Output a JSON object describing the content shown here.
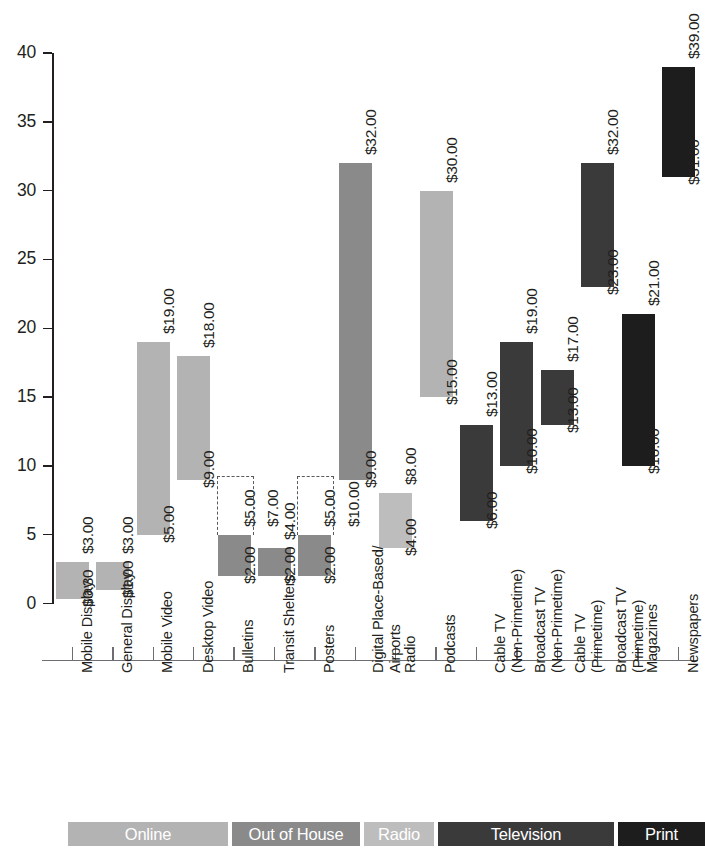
{
  "chart_data": {
    "type": "bar",
    "chart_style": "floating-range-bar",
    "title": "",
    "subtitle": "",
    "xlabel": "",
    "ylabel": "",
    "ylim": [
      0,
      40
    ],
    "y_ticks": [
      "0",
      "5",
      "10",
      "15",
      "20",
      "25",
      "30",
      "35",
      "40"
    ],
    "grid": false,
    "legend_position": "bottom",
    "categories": [
      "Mobile Display",
      "General Display",
      "Mobile Video",
      "Desktop Video",
      "Bulletins",
      "Transit Shelters",
      "Posters",
      "Digital Place-Based/ Airports",
      "Radio",
      "Podcasts",
      "Cable TV (Non-Primetime)",
      "Broadcast TV (Non-Primetime)",
      "Cable TV (Primetime)",
      "Broadcast TV (Primetime)",
      "Magazines",
      "Newspapers"
    ],
    "series": [
      {
        "name": "low",
        "values": [
          0.3,
          1.0,
          5.0,
          9.0,
          2.0,
          2.0,
          2.0,
          9.0,
          4.0,
          15.0,
          6.0,
          10.0,
          13.0,
          23.0,
          10.0,
          31.0
        ]
      },
      {
        "name": "high",
        "values": [
          3.0,
          3.0,
          19.0,
          18.0,
          5.0,
          4.0,
          5.0,
          32.0,
          8.0,
          30.0,
          13.0,
          19.0,
          17.0,
          32.0,
          21.0,
          39.0
        ]
      }
    ],
    "extended_high": [
      null,
      null,
      null,
      null,
      7.0,
      null,
      10.0,
      null,
      null,
      null,
      null,
      null,
      null,
      null,
      null,
      null
    ],
    "bars": [
      {
        "label": "Mobile Display",
        "group": "Online",
        "low": 0.3,
        "high": 3.0,
        "low_text": "$0.30",
        "high_text": "$3.00",
        "extra_text": null,
        "highlight": false
      },
      {
        "label": "General Display",
        "group": "Online",
        "low": 1.0,
        "high": 3.0,
        "low_text": "$1.00",
        "high_text": "$3.00",
        "extra_text": null,
        "highlight": false
      },
      {
        "label": "Mobile Video",
        "group": "Online",
        "low": 5.0,
        "high": 19.0,
        "low_text": "$5.00",
        "high_text": "$19.00",
        "extra_text": null,
        "highlight": false
      },
      {
        "label": "Desktop Video",
        "group": "Online",
        "low": 9.0,
        "high": 18.0,
        "low_text": "$9.00",
        "high_text": "$18.00",
        "extra_text": null,
        "highlight": false
      },
      {
        "label": "Bulletins",
        "group": "Out of House",
        "low": 2.0,
        "high": 5.0,
        "low_text": "$2.00",
        "high_text": "$5.00",
        "extra_text": "$7.00",
        "highlight": true
      },
      {
        "label": "Transit Shelters",
        "group": "Out of House",
        "low": 2.0,
        "high": 4.0,
        "low_text": "$2.00",
        "high_text": "$4.00",
        "extra_text": null,
        "highlight": false
      },
      {
        "label": "Posters",
        "group": "Out of House",
        "low": 2.0,
        "high": 5.0,
        "low_text": "$2.00",
        "high_text": "$5.00",
        "extra_text": "$10.00",
        "highlight": true
      },
      {
        "label": "Digital Place-Based/ Airports",
        "group": "Out of House",
        "low": 9.0,
        "high": 32.0,
        "low_text": "$9.00",
        "high_text": "$32.00",
        "extra_text": null,
        "highlight": false
      },
      {
        "label": "Radio",
        "group": "Radio",
        "low": 4.0,
        "high": 8.0,
        "low_text": "$4.00",
        "high_text": "$8.00",
        "extra_text": null,
        "highlight": false
      },
      {
        "label": "Podcasts",
        "group": "Online",
        "low": 15.0,
        "high": 30.0,
        "low_text": "$15.00",
        "high_text": "$30.00",
        "extra_text": null,
        "highlight": false
      },
      {
        "label": "Cable TV (Non-Primetime)",
        "group": "Television",
        "low": 6.0,
        "high": 13.0,
        "low_text": "$6.00",
        "high_text": "$13.00",
        "extra_text": null,
        "highlight": false
      },
      {
        "label": "Broadcast TV (Non-Primetime)",
        "group": "Television",
        "low": 10.0,
        "high": 19.0,
        "low_text": "$10.00",
        "high_text": "$19.00",
        "extra_text": null,
        "highlight": false
      },
      {
        "label": "Cable TV (Primetime)",
        "group": "Television",
        "low": 13.0,
        "high": 17.0,
        "low_text": "$13.00",
        "high_text": "$17.00",
        "extra_text": null,
        "highlight": false
      },
      {
        "label": "Broadcast TV (Primetime)",
        "group": "Television",
        "low": 23.0,
        "high": 32.0,
        "low_text": "$23.00",
        "high_text": "$32.00",
        "extra_text": null,
        "highlight": false
      },
      {
        "label": "Magazines",
        "group": "Print",
        "low": 10.0,
        "high": 21.0,
        "low_text": "$10.00",
        "high_text": "$21.00",
        "extra_text": null,
        "highlight": false
      },
      {
        "label": "Newspapers",
        "group": "Print",
        "low": 31.0,
        "high": 39.0,
        "low_text": "$31.00",
        "high_text": "$39.00",
        "extra_text": null,
        "highlight": false
      }
    ],
    "legend": [
      {
        "label": "Online",
        "color": "#b3b3b3"
      },
      {
        "label": "Out of House",
        "color": "#8a8a8a"
      },
      {
        "label": "Radio",
        "color": "#bdbdbd"
      },
      {
        "label": "Television",
        "color": "#3a3a3a"
      },
      {
        "label": "Print",
        "color": "#1d1d1d"
      }
    ],
    "colors": {
      "Online": "#b3b3b3",
      "Out of House": "#8a8a8a",
      "Radio": "#bdbdbd",
      "Television": "#3a3a3a",
      "Print": "#1d1d1d",
      "axis": "#231f20",
      "tick": "#6d6e71",
      "highlight_box": "#58595b"
    }
  }
}
